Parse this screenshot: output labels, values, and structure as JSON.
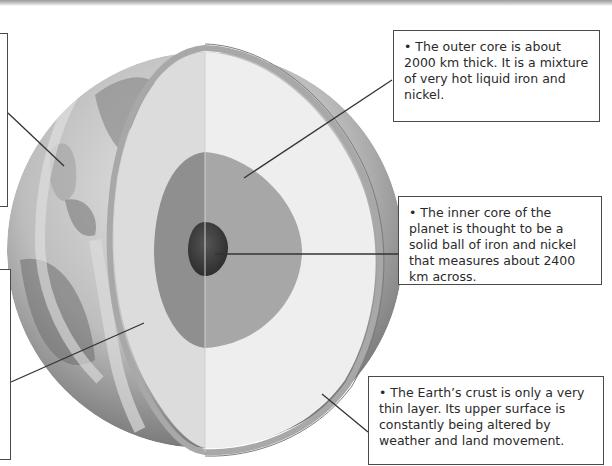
{
  "diagram": {
    "layers": [
      {
        "name": "crust",
        "color": "#b3b3b3"
      },
      {
        "name": "mantle",
        "color": "#e9e9e9"
      },
      {
        "name": "outer-core",
        "color": "#a9a9a9"
      },
      {
        "name": "inner-core",
        "color": "#3f3f3f"
      }
    ]
  },
  "callouts": {
    "outer_core": "• The outer core is about 2000 km thick. It is a mixture of very hot liquid iron and nickel.",
    "inner_core": "• The inner core of the planet is thought to be a solid ball of iron and nickel that measures about 2400 km across.",
    "crust": "• The Earth’s crust is only a very thin layer. Its upper surface is constantly being altered by weather and land movement."
  }
}
